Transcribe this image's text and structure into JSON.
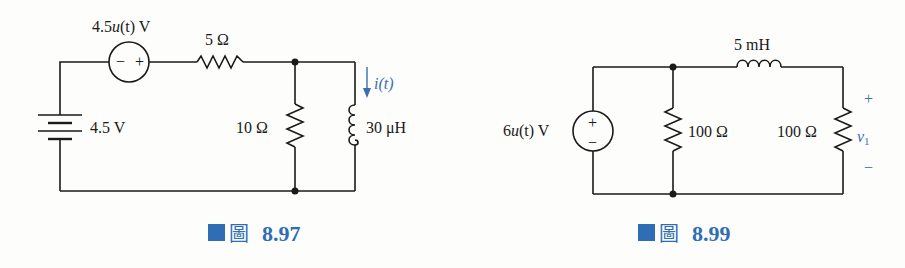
{
  "figure_left": {
    "caption_prefix": "圖",
    "caption_number": "8.97",
    "step_source": {
      "label_pre": "4.5",
      "label_fn": "u",
      "label_arg": "(t)",
      "label_unit": " V",
      "minus": "−",
      "plus": "+"
    },
    "battery": {
      "label": "4.5 V"
    },
    "series_resistor": {
      "label": "5 Ω"
    },
    "shunt_resistor": {
      "label": "10 Ω"
    },
    "inductor": {
      "label": "30 μH"
    },
    "current": {
      "label": "i(t)"
    }
  },
  "figure_right": {
    "caption_prefix": "圖",
    "caption_number": "8.99",
    "step_source": {
      "label_pre": "6",
      "label_fn": "u",
      "label_arg": "(t)",
      "label_unit": " V",
      "plus": "+",
      "minus": "−"
    },
    "shunt_resistor": {
      "label": "100 Ω"
    },
    "inductor": {
      "label": "5 mH"
    },
    "load_resistor": {
      "label": "100 Ω"
    },
    "voltage": {
      "label": "v",
      "subscript": "1",
      "plus": "+",
      "minus": "−"
    }
  },
  "colors": {
    "wire": "#1a1a1a",
    "accent": "#2f6db5"
  }
}
